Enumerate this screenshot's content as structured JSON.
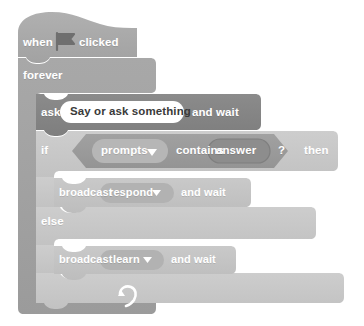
{
  "editor": {
    "name": "scratch-block-canvas",
    "background_color": "#ffffff"
  },
  "palette": {
    "events_block_color": "#a8a8a8",
    "control_block_color": "#a0a0a0",
    "control_inner_color": "#c8c8c8",
    "sensing_block_color": "#848484",
    "operator_block_color": "#9a9a9a",
    "operator_inset_color": "#b4b4b4",
    "reporter_color": "#8e8e8e",
    "broadcast_block_color": "#c3c3c3",
    "dropdown_color": "#b0b0b0",
    "text_input_color": "#ffffff",
    "label_color": "#ffffff",
    "input_text_color": "#3a3a3a"
  },
  "script": {
    "name": "chatbot-script",
    "blocks": [
      {
        "id": "when-flag-clicked",
        "type": "hat",
        "category": "events",
        "label_before": "when",
        "icon": "green-flag-icon",
        "label_after": "clicked"
      },
      {
        "id": "forever",
        "type": "c-loop",
        "category": "control",
        "label": "forever",
        "loop_icon": "loop-arrow-icon"
      },
      {
        "id": "ask-and-wait",
        "type": "stack",
        "category": "sensing",
        "label_before": "ask",
        "input_value": "Say or ask something",
        "input_placeholder": "Say or ask something",
        "label_after": "and wait"
      },
      {
        "id": "if-else",
        "type": "c-conditional",
        "category": "control",
        "label_if": "if",
        "label_then": "then",
        "label_else": "else"
      },
      {
        "id": "contains-operator",
        "type": "boolean",
        "category": "operator",
        "dropdown_value": "prompts",
        "label_middle": "contains",
        "reporter_value": "answer",
        "label_end": "?"
      },
      {
        "id": "broadcast-respond-and-wait",
        "type": "stack",
        "category": "events",
        "label_before": "broadcast",
        "dropdown_value": "respond",
        "label_after": "and wait"
      },
      {
        "id": "broadcast-learn-and-wait",
        "type": "stack",
        "category": "events",
        "label_before": "broadcast",
        "dropdown_value": "learn",
        "label_after": "and wait"
      }
    ]
  },
  "labels": {
    "when": "when",
    "clicked": "clicked",
    "forever": "forever",
    "ask": "ask",
    "ask_input": "Say or ask something",
    "and_wait": "and wait",
    "if": "if",
    "then": "then",
    "else": "else",
    "prompts": "prompts",
    "contains": "contains",
    "answer": "answer",
    "question_mark": "?",
    "broadcast": "broadcast",
    "respond": "respond",
    "learn": "learn",
    "dropdown_arrow": "▾"
  }
}
